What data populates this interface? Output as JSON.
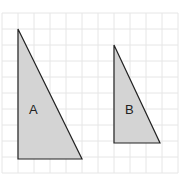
{
  "diagram": {
    "grid": {
      "x0": 2,
      "y0": 13,
      "cols": 11,
      "rows": 10,
      "cell": 16,
      "line_color": "#e6e6e6"
    },
    "fill_color": "#d4d4d4",
    "stroke_color": "#222222",
    "shapes": [
      {
        "label": "A",
        "points": "18,29 18,159 82,159",
        "label_x": 29,
        "label_y": 114
      },
      {
        "label": "B",
        "points": "114,45 114,143 160,143",
        "label_x": 125,
        "label_y": 114
      }
    ]
  }
}
